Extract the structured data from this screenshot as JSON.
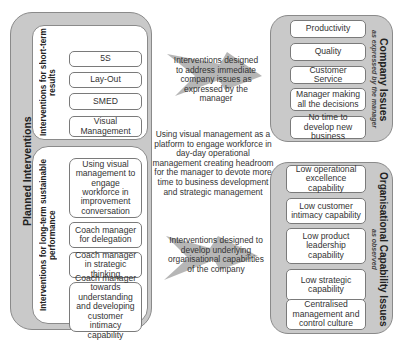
{
  "left_panel": {
    "title": "Planned Interventions",
    "short_term": {
      "label": "Interventions for short-term results",
      "items": [
        "5S",
        "Lay-Out",
        "SMED",
        "Visual Management"
      ]
    },
    "long_term": {
      "label": "Interventions for long-term sustainable performance",
      "items": [
        "Using visual management to engage workforce in improvement conversation",
        "Coach manager for delegation",
        "Coach manager in strategic thinking",
        "Coach manager towards understanding and developing customer intimacy capability"
      ]
    }
  },
  "middle": {
    "top_arrow_text": "Interventions designed to address immediate company issues as expressed by the manager",
    "center_text": "Using visual management as a platform to engage workforce in day-day operational management creating headroom for the manager to devote more time to business development and strategic management",
    "bottom_arrow_text": "Interventions designed to develop underlying organisational capabilities of the company"
  },
  "company_issues": {
    "title": "Company Issues",
    "subtitle": "as expressed by the manager",
    "items": [
      "Productivity",
      "Quality",
      "Customer Service",
      "Manager making all the decisions",
      "No time to develop new business"
    ]
  },
  "capability_issues": {
    "title": "Organisational Capability Issues",
    "subtitle": "as observed",
    "items": [
      "Low operational excellence capability",
      "Low customer intimacy capability",
      "Low product leadership capability",
      "Low strategic capability",
      "Centralised management and control culture"
    ]
  },
  "colors": {
    "panel_fill": "#c9c9c9",
    "border": "#8a8a8a",
    "arrow": "#a9a9a9"
  }
}
